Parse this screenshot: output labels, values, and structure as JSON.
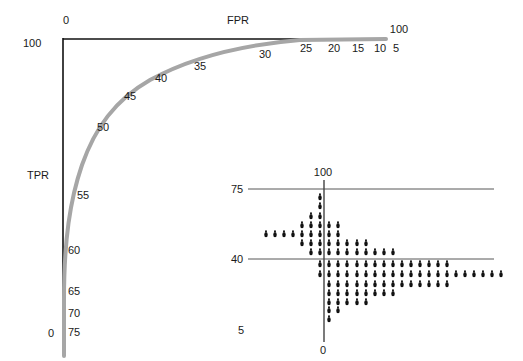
{
  "chart_data": {
    "type": "line",
    "title": "",
    "roc": {
      "xlabel": "FPR",
      "ylabel": "TPR",
      "x_ticks": {
        "left": "0",
        "right": "100"
      },
      "y_ticks": {
        "top": "100",
        "bottom": "0"
      },
      "threshold_labels": [
        "5",
        "10",
        "15",
        "20",
        "25",
        "30",
        "35",
        "40",
        "45",
        "50",
        "55",
        "60",
        "65",
        "70",
        "75"
      ],
      "curve_color": "#a6a6a6",
      "axis_color": "#111111"
    },
    "inset": {
      "type": "dotplot",
      "y_labels": {
        "top": "100",
        "upper": "75",
        "middle": "40",
        "bottom": "5"
      },
      "x_label": "0",
      "rows": [
        {
          "row": 0,
          "from": 6,
          "to": 6
        },
        {
          "row": 1,
          "from": 6,
          "to": 6
        },
        {
          "row": 2,
          "from": 5,
          "to": 6
        },
        {
          "row": 3,
          "from": 4,
          "to": 8
        },
        {
          "row": 4,
          "from": 0,
          "to": 8
        },
        {
          "row": 5,
          "from": 4,
          "to": 11
        },
        {
          "row": 6,
          "from": 5,
          "to": 14
        },
        {
          "row": 7,
          "from": 6,
          "to": 20
        },
        {
          "row": 8,
          "from": 6,
          "to": 26
        },
        {
          "row": 9,
          "from": 7,
          "to": 20
        },
        {
          "row": 10,
          "from": 7,
          "to": 14
        },
        {
          "row": 11,
          "from": 7,
          "to": 11
        },
        {
          "row": 12,
          "from": 7,
          "to": 8
        },
        {
          "row": 13,
          "from": 7,
          "to": 7
        }
      ]
    }
  },
  "labels": {
    "fpr": "FPR",
    "tpr": "TPR",
    "x0": "0",
    "x100": "100",
    "y100": "100",
    "y0": "0",
    "t5": "5",
    "t10": "10",
    "t15": "15",
    "t20": "20",
    "t25": "25",
    "t30": "30",
    "t35": "35",
    "t40": "40",
    "t45": "45",
    "t50": "50",
    "t55": "55",
    "t60": "60",
    "t65": "65",
    "t70": "70",
    "t75": "75",
    "inset_100": "100",
    "inset_75": "75",
    "inset_40": "40",
    "inset_5": "5",
    "inset_0": "0"
  }
}
